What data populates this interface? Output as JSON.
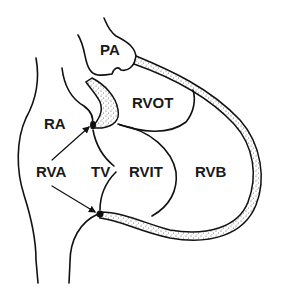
{
  "diagram": {
    "type": "anatomical-schematic",
    "labels": {
      "pa": "PA",
      "rvot": "RVOT",
      "ra": "RA",
      "rva": "RVA",
      "tv": "TV",
      "rvit": "RVIT",
      "rvb": "RVB"
    },
    "colors": {
      "ink": "#111111",
      "background": "#ffffff",
      "stipple": "#555555"
    }
  }
}
